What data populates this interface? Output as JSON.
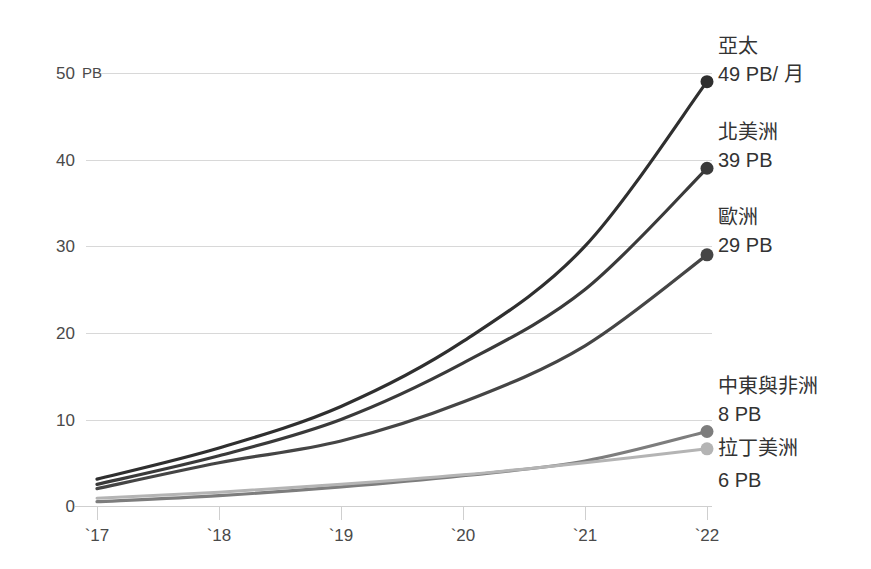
{
  "chart_data": {
    "type": "line",
    "title": "",
    "subtitle": "",
    "xlabel": "",
    "ylabel": "PB",
    "y_unit": "PB",
    "x": [
      "`17",
      "`18",
      "`19",
      "`20",
      "`21",
      "`22"
    ],
    "categories": [
      "`17",
      "`18",
      "`19",
      "`20",
      "`21",
      "`22"
    ],
    "xlim": [
      0,
      5
    ],
    "ylim": [
      0,
      50
    ],
    "y_ticks": [
      0,
      10,
      20,
      30,
      40,
      50
    ],
    "y_tick_labels": [
      "0",
      "10",
      "20",
      "30",
      "40",
      "50"
    ],
    "x_tick_labels": [
      "`17",
      "`18",
      "`19",
      "`20",
      "`21",
      "`22"
    ],
    "grid": true,
    "legend_position": "right-endpoint-labels",
    "series": [
      {
        "name": "亞太",
        "end_label": "49 PB/ 月",
        "end_value": 49,
        "color": "#2f2f2f",
        "values": [
          3.1,
          6.7,
          11.5,
          19.0,
          30.0,
          49.0
        ]
      },
      {
        "name": "北美洲",
        "end_label": "39 PB",
        "end_value": 39,
        "color": "#3a3a3a",
        "values": [
          2.5,
          5.8,
          10.0,
          16.5,
          25.0,
          39.0
        ]
      },
      {
        "name": "歐洲",
        "end_label": "29 PB",
        "end_value": 29,
        "color": "#454545",
        "values": [
          2.0,
          5.0,
          7.5,
          12.0,
          18.5,
          29.0
        ]
      },
      {
        "name": "中東與非洲",
        "end_label": "8 PB",
        "end_value": 8,
        "color": "#7d7d7d",
        "values": [
          0.5,
          1.2,
          2.2,
          3.5,
          5.2,
          8.6
        ]
      },
      {
        "name": "拉丁美洲",
        "end_label": "6 PB",
        "end_value": 6,
        "color": "#b4b4b4",
        "values": [
          0.9,
          1.6,
          2.5,
          3.6,
          5.0,
          6.6
        ]
      }
    ],
    "colors": {
      "gridline": "#d8d8d8",
      "axis": "#cfcfcf",
      "text": "#3a3a3a",
      "background": "#ffffff"
    },
    "annotations": [
      {
        "series": "亞太",
        "name": "亞太",
        "value_text": "49 PB/ 月"
      },
      {
        "series": "北美洲",
        "name": "北美洲",
        "value_text": "39 PB"
      },
      {
        "series": "歐洲",
        "name": "歐洲",
        "value_text": "29 PB"
      },
      {
        "series": "中東與非洲",
        "name": "中東與非洲",
        "value_text": "8 PB"
      },
      {
        "series": "拉丁美洲",
        "name": "拉丁美洲",
        "value_text": "6 PB"
      }
    ]
  },
  "labels": {
    "y_unit": "PB",
    "y0": "0",
    "y10": "10",
    "y20": "20",
    "y30": "30",
    "y40": "40",
    "y50": "50",
    "x17": "`17",
    "x18": "`18",
    "x19": "`19",
    "x20": "`20",
    "x21": "`21",
    "x22": "`22",
    "s0_name": "亞太",
    "s0_value": "49 PB/ 月",
    "s1_name": "北美洲",
    "s1_value": "39 PB",
    "s2_name": "歐洲",
    "s2_value": "29 PB",
    "s3_name": "中東與非洲",
    "s3_value": "8 PB",
    "s4_name": "拉丁美洲",
    "s4_value": "6 PB"
  }
}
